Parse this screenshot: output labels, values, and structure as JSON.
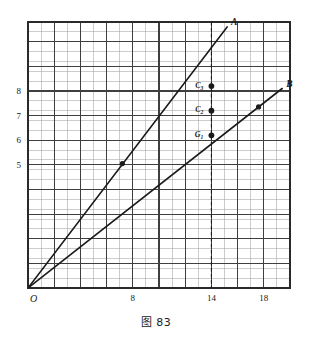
{
  "figure": {
    "caption": "图 83",
    "origin_label": "O"
  },
  "chart_data": {
    "type": "line",
    "title": "图 83",
    "xlabel": "",
    "ylabel": "",
    "grid": true,
    "grid_minor": true,
    "legend": "inline-endpoint-labels",
    "xlim": [
      0,
      20
    ],
    "ylim": [
      0,
      10.8
    ],
    "xticks": [
      8,
      14,
      18
    ],
    "xticklabels": [
      "8",
      "14",
      "18"
    ],
    "yticks": [
      5,
      6,
      7,
      8
    ],
    "yticklabels": [
      "5",
      "6",
      "7",
      "8"
    ],
    "series": [
      {
        "name": "A",
        "label": "A",
        "x": [
          0,
          15.2
        ],
        "y": [
          0,
          10.6
        ],
        "slope": 0.7,
        "points": [
          {
            "x": 7.2,
            "y": 5.05,
            "label": ""
          }
        ]
      },
      {
        "name": "B",
        "label": "B",
        "x": [
          0,
          19.4
        ],
        "y": [
          0,
          8.1
        ],
        "slope": 0.418,
        "points": [
          {
            "x": 17.6,
            "y": 7.35,
            "label": ""
          }
        ]
      }
    ],
    "annotations": [
      {
        "kind": "vline",
        "x": 14,
        "style": "dashed",
        "label": ""
      }
    ],
    "marked_points": [
      {
        "label": "C3",
        "label_text": "C",
        "sub": "3",
        "x": 14,
        "y": 8.2
      },
      {
        "label": "C2",
        "label_text": "C",
        "sub": "2",
        "x": 14,
        "y": 7.2
      },
      {
        "label": "G1",
        "label_text": "G",
        "sub": "1",
        "x": 14,
        "y": 6.2
      }
    ]
  },
  "colors": {
    "ink": "#1b1b1b",
    "grid_minor": "#8d8d8d",
    "grid_major": "#3a3a3a",
    "frame": "#2a2a2a",
    "paper": "#ffffff"
  }
}
